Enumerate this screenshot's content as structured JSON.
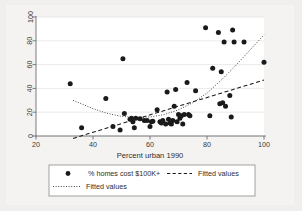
{
  "chart_data": {
    "type": "scatter",
    "title": "",
    "xlabel": "Percent urban 1990",
    "ylabel": "",
    "xlim": [
      20,
      100
    ],
    "ylim": [
      0,
      100
    ],
    "xticks": [
      20,
      40,
      60,
      80,
      100
    ],
    "yticks": [
      0,
      20,
      40,
      60,
      80,
      100
    ],
    "grid": "horizontal",
    "legend_position": "below-plot",
    "series": [
      {
        "name": "% homes cost $100K+",
        "type": "scatter",
        "marker": "filled-circle",
        "color": "#1a1a1a",
        "points": [
          [
            32,
            44
          ],
          [
            36,
            7
          ],
          [
            44.5,
            31.5
          ],
          [
            47,
            8
          ],
          [
            49.5,
            5
          ],
          [
            50.5,
            65
          ],
          [
            51,
            19
          ],
          [
            53,
            14
          ],
          [
            53.5,
            15
          ],
          [
            54,
            12
          ],
          [
            54.5,
            7
          ],
          [
            55,
            15
          ],
          [
            56.5,
            14.5
          ],
          [
            58,
            13
          ],
          [
            59,
            13
          ],
          [
            60,
            8
          ],
          [
            60.5,
            12
          ],
          [
            61,
            12.5
          ],
          [
            62.5,
            22
          ],
          [
            63.5,
            12
          ],
          [
            64,
            11
          ],
          [
            64.5,
            13
          ],
          [
            65.5,
            10
          ],
          [
            66,
            37
          ],
          [
            66.5,
            14
          ],
          [
            67,
            11
          ],
          [
            67.5,
            10
          ],
          [
            68,
            13
          ],
          [
            68.5,
            25
          ],
          [
            69,
            39
          ],
          [
            69.5,
            12
          ],
          [
            70,
            18
          ],
          [
            70.5,
            15
          ],
          [
            71,
            17
          ],
          [
            71.5,
            10
          ],
          [
            72,
            18
          ],
          [
            73,
            45
          ],
          [
            73.5,
            18
          ],
          [
            74,
            17
          ],
          [
            76,
            38
          ],
          [
            79.5,
            91
          ],
          [
            81,
            17
          ],
          [
            82,
            57
          ],
          [
            84,
            87
          ],
          [
            84.5,
            27
          ],
          [
            85,
            54
          ],
          [
            85.5,
            28
          ],
          [
            86,
            79
          ],
          [
            86.5,
            25
          ],
          [
            88,
            34
          ],
          [
            88.5,
            16
          ],
          [
            89,
            89
          ],
          [
            89.5,
            79
          ],
          [
            93,
            79
          ],
          [
            100,
            62
          ]
        ]
      },
      {
        "name": "Fitted values",
        "type": "line",
        "style": "dashed",
        "color": "#1a1a1a",
        "points": [
          [
            33,
            -2
          ],
          [
            100,
            47
          ]
        ]
      },
      {
        "name": "Fitted values",
        "type": "line",
        "style": "dotted",
        "color": "#1a1a1a",
        "points": [
          [
            33,
            30
          ],
          [
            40,
            23
          ],
          [
            45,
            19
          ],
          [
            50,
            16.5
          ],
          [
            55,
            15.5
          ],
          [
            60,
            16
          ],
          [
            65,
            18
          ],
          [
            70,
            22
          ],
          [
            75,
            28
          ],
          [
            80,
            36
          ],
          [
            85,
            47
          ],
          [
            90,
            59
          ],
          [
            95,
            72
          ],
          [
            100,
            85
          ]
        ]
      }
    ]
  },
  "axes": {
    "x_tick_labels": [
      "20",
      "40",
      "60",
      "80",
      "100"
    ],
    "y_tick_labels": [
      "0",
      "20",
      "40",
      "60",
      "80",
      "100"
    ],
    "x_title": "Percent urban 1990"
  },
  "legend": {
    "entries": [
      {
        "label": "% homes cost $100K+",
        "marker": "filled-circle"
      },
      {
        "label": "Fitted values",
        "marker": "dashed-line"
      },
      {
        "label": "Fitted values",
        "marker": "dotted-line"
      }
    ]
  },
  "colors": {
    "page_background": "#ececeb",
    "plot_background": "#ffffff",
    "figure_background": "#f0efee",
    "marker": "#1a1a1a",
    "axis": "#6e6e6e",
    "grid": "#d8d8d8",
    "legend_border": "#8a8a8a"
  }
}
